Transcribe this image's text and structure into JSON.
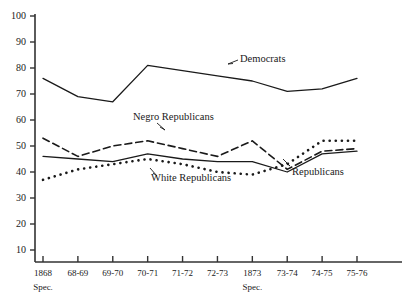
{
  "chart_data": {
    "type": "line",
    "title": "",
    "xlabel": "",
    "ylabel": "",
    "ylim": [
      0,
      100
    ],
    "yticks": [
      10,
      20,
      30,
      40,
      50,
      60,
      70,
      80,
      90,
      100
    ],
    "grid": false,
    "legend_position": "inline-annotations",
    "categories": [
      "1868 Spec.",
      "68-69",
      "69-70",
      "70-71",
      "71-72",
      "72-73",
      "1873 Spec.",
      "73-74",
      "74-75",
      "75-76"
    ],
    "xtick_labels": [
      "1868",
      "68-69",
      "69-70",
      "70-71",
      "71-72",
      "72-73",
      "1873",
      "73-74",
      "74-75",
      "75-76"
    ],
    "xtick_sublabels": [
      "Spec.",
      "",
      "",
      "",
      "",
      "",
      "Spec.",
      "",
      "",
      ""
    ],
    "series": [
      {
        "name": "Democrats",
        "style": "solid",
        "values": [
          76,
          69,
          67,
          81,
          79,
          77,
          75,
          71,
          72,
          76
        ]
      },
      {
        "name": "Negro Republicans",
        "style": "dashed",
        "values": [
          53,
          46,
          50,
          52,
          49,
          46,
          52,
          41,
          48,
          49
        ]
      },
      {
        "name": "Republicans",
        "style": "solid",
        "values": [
          46,
          45,
          44,
          47,
          45,
          44,
          44,
          40,
          47,
          48
        ]
      },
      {
        "name": "White Republicans",
        "style": "dotted",
        "values": [
          37,
          41,
          43,
          45,
          43,
          40,
          39,
          43,
          52,
          52
        ]
      }
    ],
    "annotations": [
      {
        "text": "Democrats",
        "series": "Democrats"
      },
      {
        "text": "Negro Republicans",
        "series": "Negro Republicans"
      },
      {
        "text": "White Republicans",
        "series": "White Republicans"
      },
      {
        "text": "Republicans",
        "series": "Republicans"
      }
    ],
    "colors": {
      "line": "#1a1a1a",
      "axis": "#333333",
      "background": "#ffffff"
    }
  }
}
